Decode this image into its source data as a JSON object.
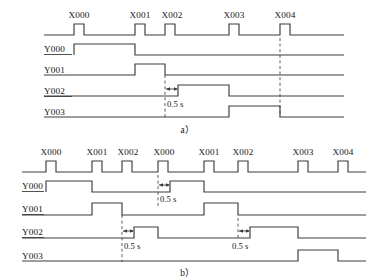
{
  "figure": {
    "panels": [
      {
        "id": "a",
        "caption": "a）",
        "inputs": {
          "name": "input-pulse-train",
          "pulses": [
            {
              "label": "X000",
              "x": 74,
              "width": 10
            },
            {
              "label": "X001",
              "x": 135,
              "width": 10
            },
            {
              "label": "X002",
              "x": 165,
              "width": 10
            },
            {
              "label": "X003",
              "x": 229,
              "width": 10
            },
            {
              "label": "X004",
              "x": 280,
              "width": 10
            }
          ]
        },
        "outputs": [
          {
            "label": "Y000",
            "segments": [
              {
                "on": 74,
                "off": 135
              }
            ]
          },
          {
            "label": "Y001",
            "segments": [
              {
                "on": 135,
                "off": 165
              }
            ]
          },
          {
            "label": "Y002",
            "segments": [
              {
                "on": 178,
                "off": 229
              }
            ]
          },
          {
            "label": "Y003",
            "segments": [
              {
                "on": 229,
                "off": 280
              }
            ]
          }
        ],
        "annotations": [
          {
            "text": "0.5 s",
            "from": 165,
            "to": 178,
            "row": "Y002"
          }
        ],
        "dashed_markers": [
          165,
          280
        ]
      },
      {
        "id": "b",
        "caption": "b）",
        "inputs": {
          "name": "input-pulse-train",
          "pulses": [
            {
              "label": "X000",
              "x": 46,
              "width": 10
            },
            {
              "label": "X001",
              "x": 92,
              "width": 10
            },
            {
              "label": "X002",
              "x": 122,
              "width": 10
            },
            {
              "label": "X000",
              "x": 158,
              "width": 10
            },
            {
              "label": "X001",
              "x": 204,
              "width": 10
            },
            {
              "label": "X002",
              "x": 238,
              "width": 10
            },
            {
              "label": "X003",
              "x": 298,
              "width": 10
            },
            {
              "label": "X004",
              "x": 338,
              "width": 10
            }
          ]
        },
        "outputs": [
          {
            "label": "Y000",
            "segments": [
              {
                "on": 46,
                "off": 92
              },
              {
                "on": 170,
                "off": 204
              }
            ]
          },
          {
            "label": "Y001",
            "segments": [
              {
                "on": 92,
                "off": 122
              },
              {
                "on": 204,
                "off": 238
              }
            ]
          },
          {
            "label": "Y002",
            "segments": [
              {
                "on": 134,
                "off": 158
              },
              {
                "on": 250,
                "off": 298
              }
            ]
          },
          {
            "label": "Y003",
            "segments": [
              {
                "on": 298,
                "off": 338
              }
            ]
          }
        ],
        "annotations": [
          {
            "text": "0.5 s",
            "from": 158,
            "to": 170,
            "row": "Y000"
          },
          {
            "text": "0.5 s",
            "from": 122,
            "to": 134,
            "row": "Y002"
          },
          {
            "text": "0.5 s",
            "from": 238,
            "to": 250,
            "row": "Y002"
          }
        ],
        "dashed_markers": [
          122,
          158,
          238
        ]
      }
    ],
    "colors": {
      "stroke": "#3c3c3c",
      "text": "#141414",
      "background": "#ffffff"
    }
  }
}
